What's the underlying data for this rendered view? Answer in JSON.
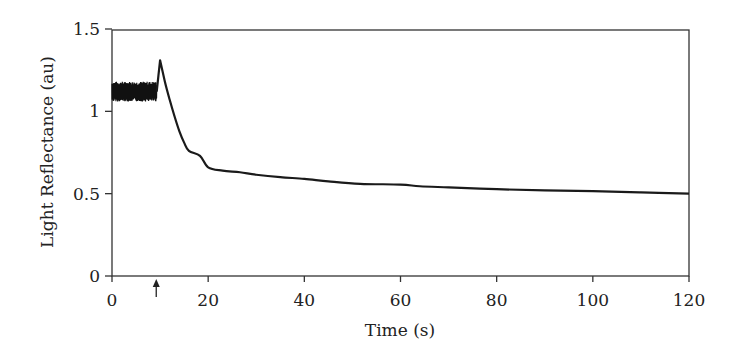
{
  "chart_data": {
    "type": "line",
    "title": "",
    "xlabel": "Time (s)",
    "ylabel": "Light Reflectance (au)",
    "xlim": [
      0,
      120
    ],
    "ylim": [
      0,
      1.5
    ],
    "xticks": [
      0,
      20,
      40,
      60,
      80,
      100,
      120
    ],
    "xtick_labels": [
      "0",
      "20",
      "40",
      "60",
      "80",
      "100",
      "120"
    ],
    "yticks": [
      0,
      0.5,
      1,
      1.5
    ],
    "ytick_labels": [
      "0",
      "0.5",
      "1",
      "1.5"
    ],
    "grid": false,
    "legend": null,
    "frame": "box",
    "series": [
      {
        "name": "Light reflectance",
        "noisy_baseline": {
          "t_start": 0,
          "t_end": 9.3,
          "mean": 1.12,
          "min": 1.06,
          "max": 1.18
        },
        "x": [
          9.3,
          10.0,
          11.0,
          12.0,
          13.0,
          14.0,
          15.0,
          16.0,
          18.3,
          20,
          23,
          26.6,
          30,
          35,
          40,
          45,
          51.6,
          60,
          64,
          70,
          80,
          90,
          100,
          110,
          120
        ],
        "values": [
          1.12,
          1.31,
          1.18,
          1.07,
          0.97,
          0.88,
          0.81,
          0.76,
          0.73,
          0.66,
          0.64,
          0.63,
          0.615,
          0.6,
          0.59,
          0.575,
          0.56,
          0.555,
          0.545,
          0.538,
          0.527,
          0.52,
          0.515,
          0.508,
          0.5
        ]
      }
    ],
    "annotations": [
      {
        "type": "arrow",
        "direction": "up",
        "x": 9.2,
        "position": "below x-axis",
        "meaning": "stimulus onset"
      }
    ]
  }
}
